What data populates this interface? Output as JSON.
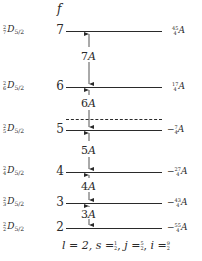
{
  "diagram": {
    "f_axis_label": "f",
    "levels": [
      {
        "f": "7",
        "term_mult": "2",
        "term_f": "7",
        "term_letter": "D",
        "term_j": "5/2",
        "energy_sign": "",
        "energy_num": "45",
        "energy_den": "4",
        "energy_unit": "A",
        "y": 31
      },
      {
        "f": "6",
        "term_mult": "2",
        "term_f": "6",
        "term_letter": "D",
        "term_j": "5/2",
        "energy_sign": "",
        "energy_num": "17",
        "energy_den": "4",
        "energy_unit": "A",
        "y": 87
      },
      {
        "f": "5",
        "term_mult": "2",
        "term_f": "5",
        "term_letter": "D",
        "term_j": "5/2",
        "energy_sign": "−",
        "energy_num": "7",
        "energy_den": "4",
        "energy_unit": "A",
        "y": 130
      },
      {
        "f": "4",
        "term_mult": "2",
        "term_f": "4",
        "term_letter": "D",
        "term_j": "5/2",
        "energy_sign": "−",
        "energy_num": "27",
        "energy_den": "4",
        "energy_unit": "A",
        "y": 172
      },
      {
        "f": "3",
        "term_mult": "2",
        "term_f": "3",
        "term_letter": "D",
        "term_j": "5/2",
        "energy_sign": "−",
        "energy_num": "43",
        "energy_den": "4",
        "energy_unit": "A",
        "y": 203
      },
      {
        "f": "2",
        "term_mult": "2",
        "term_f": "2",
        "term_letter": "D",
        "term_j": "5/2",
        "energy_sign": "−",
        "energy_num": "55",
        "energy_den": "4",
        "energy_unit": "A",
        "y": 228
      }
    ],
    "intervals": [
      {
        "coef": "7",
        "unit": "A",
        "y": 52
      },
      {
        "coef": "6",
        "unit": "A",
        "y": 100
      },
      {
        "coef": "5",
        "unit": "A",
        "y": 147
      },
      {
        "coef": "4",
        "unit": "A",
        "y": 182
      },
      {
        "coef": "3",
        "unit": "A",
        "y": 209
      }
    ],
    "unperturbed_level_y": 120,
    "footer": {
      "l": "l = 2,",
      "s_label": "s =",
      "s_num": "1",
      "s_den": "2",
      "j_label": "j =",
      "j_num": "5",
      "j_den": "2",
      "i_label": "i =",
      "i_num": "9",
      "i_den": "2"
    },
    "colors": {
      "line": "#2a2a2a",
      "text": "#2a2a2a",
      "background": "#ffffff"
    }
  }
}
